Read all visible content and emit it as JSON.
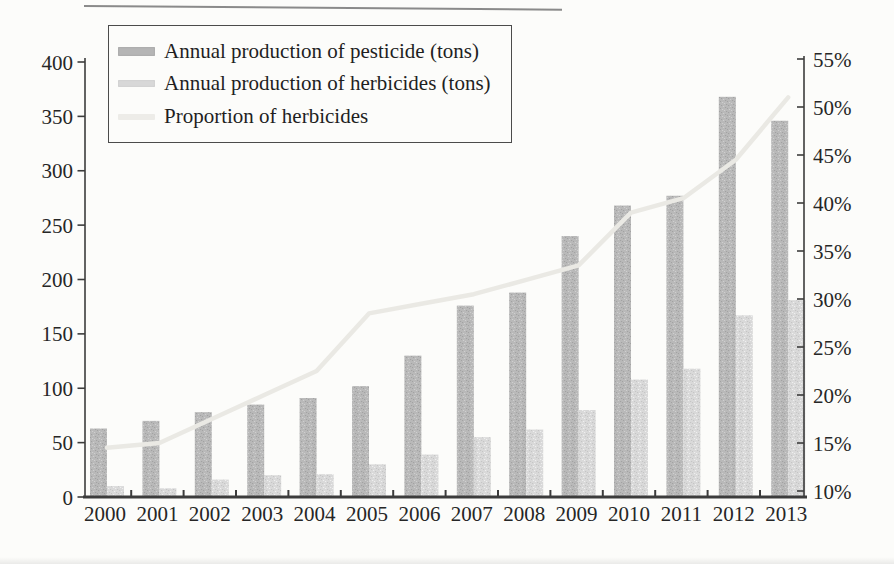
{
  "colors": {
    "pesticide": "#b9b9b9",
    "herbicide": "#d9d9d9",
    "proportion_line": "#eae9e4",
    "axis": "#3c3c3c",
    "text": "#262626",
    "background": "#fcfcfa"
  },
  "chart_data": {
    "type": "bar",
    "subtype": "grouped-bars-with-secondary-axis-line",
    "title": "",
    "xlabel": "",
    "ylabel": "",
    "grid": false,
    "legend_position": "top-left-box",
    "categories": [
      "2000",
      "2001",
      "2002",
      "2003",
      "2004",
      "2005",
      "2006",
      "2007",
      "2008",
      "2009",
      "2010",
      "2011",
      "2012",
      "2013"
    ],
    "series": [
      {
        "name": "Annual production of pesticide (tons)",
        "render": "bar",
        "axis": "left",
        "values": [
          63,
          70,
          78,
          85,
          91,
          102,
          130,
          176,
          188,
          240,
          268,
          277,
          368,
          346
        ]
      },
      {
        "name": "Annual production of herbicides (tons)",
        "render": "bar",
        "axis": "left",
        "values": [
          10,
          8,
          16,
          20,
          21,
          30,
          39,
          55,
          62,
          80,
          108,
          118,
          167,
          181
        ]
      },
      {
        "name": "Proportion of herbicides",
        "render": "line",
        "axis": "right",
        "unit": "%",
        "values": [
          14.5,
          15,
          17.5,
          20,
          22.5,
          28.5,
          29.5,
          30.5,
          32,
          33.5,
          39,
          40.5,
          44.5,
          51
        ]
      }
    ],
    "left_axis": {
      "min": 0,
      "max": 400,
      "ticks": [
        0,
        50,
        100,
        150,
        200,
        250,
        300,
        350,
        400
      ]
    },
    "right_axis": {
      "min": "10%",
      "max": "55%",
      "ticks": [
        "10%",
        "15%",
        "20%",
        "25%",
        "30%",
        "35%",
        "40%",
        "45%",
        "50%",
        "55%"
      ]
    },
    "legend": [
      "Annual production of pesticide (tons)",
      "Annual production of herbicides (tons)",
      "Proportion of herbicides"
    ]
  }
}
